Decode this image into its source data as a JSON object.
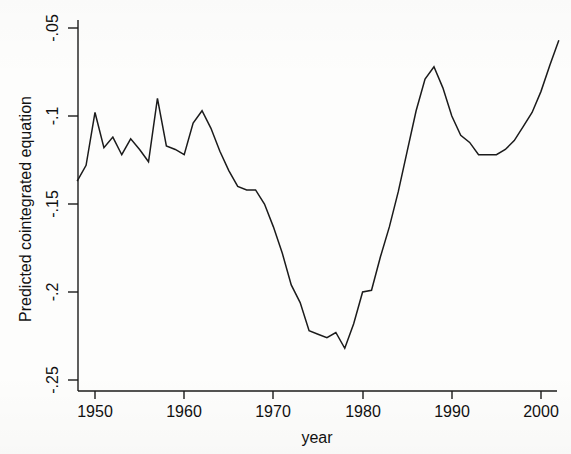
{
  "chart_data": {
    "type": "line",
    "title": "",
    "xlabel": "year",
    "ylabel": "Predicted cointegrated equation",
    "xlim": [
      1947.5,
      2002.5
    ],
    "ylim": [
      -0.2525,
      -0.0475
    ],
    "grid": false,
    "legend": null,
    "xticks": [
      1950,
      1960,
      1970,
      1980,
      1990,
      2000
    ],
    "xticklabels": [
      "1950",
      "1960",
      "1970",
      "1980",
      "1990",
      "2000"
    ],
    "yticks": [
      -0.05,
      -0.1,
      -0.15,
      -0.2,
      -0.25
    ],
    "yticklabels": [
      "-.05",
      "-.1",
      "-.15",
      "-.2",
      "-.25"
    ],
    "series": [
      {
        "name": "Predicted cointegrated equation",
        "color": "#1b1b1b",
        "x": [
          1948,
          1949,
          1950,
          1951,
          1952,
          1953,
          1954,
          1955,
          1956,
          1957,
          1958,
          1959,
          1960,
          1961,
          1962,
          1963,
          1964,
          1965,
          1966,
          1967,
          1968,
          1969,
          1970,
          1971,
          1972,
          1973,
          1974,
          1975,
          1976,
          1977,
          1978,
          1979,
          1980,
          1981,
          1982,
          1983,
          1984,
          1985,
          1986,
          1987,
          1988,
          1989,
          1990,
          1991,
          1992,
          1993,
          1994,
          1995,
          1996,
          1997,
          1998,
          1999,
          2000,
          2001,
          2002
        ],
        "y": [
          -0.137,
          -0.128,
          -0.098,
          -0.118,
          -0.112,
          -0.122,
          -0.113,
          -0.119,
          -0.126,
          -0.09,
          -0.117,
          -0.119,
          -0.122,
          -0.104,
          -0.097,
          -0.107,
          -0.12,
          -0.131,
          -0.14,
          -0.142,
          -0.142,
          -0.15,
          -0.163,
          -0.178,
          -0.196,
          -0.206,
          -0.222,
          -0.224,
          -0.226,
          -0.223,
          -0.232,
          -0.218,
          -0.2,
          -0.199,
          -0.18,
          -0.163,
          -0.143,
          -0.12,
          -0.097,
          -0.079,
          -0.072,
          -0.084,
          -0.1,
          -0.111,
          -0.115,
          -0.122,
          -0.122,
          -0.122,
          -0.119,
          -0.114,
          -0.106,
          -0.098,
          -0.086,
          -0.071,
          -0.057
        ]
      }
    ]
  },
  "axes": {
    "y_title": "Predicted cointegrated equation",
    "x_title": "year",
    "y_labels": [
      "-.05",
      "-.1",
      "-.15",
      "-.2",
      "-.25"
    ],
    "x_labels": [
      "1950",
      "1960",
      "1970",
      "1980",
      "1990",
      "2000"
    ]
  }
}
